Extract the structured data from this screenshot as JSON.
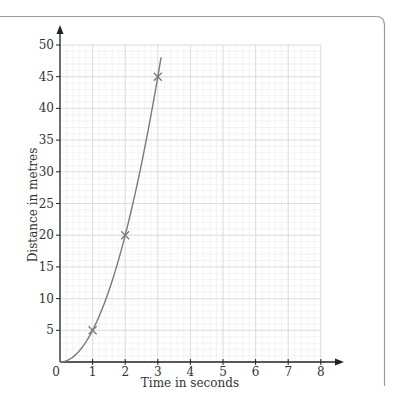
{
  "chart_data": {
    "type": "line",
    "title": "",
    "xlabel": "Time in seconds",
    "ylabel": "Distance in metres",
    "xlim": [
      0,
      8
    ],
    "ylim": [
      0,
      50
    ],
    "x_ticks": [
      "0",
      "1",
      "2",
      "3",
      "4",
      "5",
      "6",
      "7",
      "8"
    ],
    "y_ticks": [
      "5",
      "10",
      "15",
      "20",
      "25",
      "30",
      "35",
      "40",
      "45",
      "50"
    ],
    "grid": true,
    "grid_major_x": 1,
    "grid_minor_x": 0.2,
    "grid_major_y": 5,
    "grid_minor_y": 1,
    "series": [
      {
        "name": "distance curve",
        "kind": "curve",
        "formula": "d = 5t^2",
        "x": [
          0,
          0.5,
          1,
          1.5,
          2,
          2.5,
          3,
          3.1
        ],
        "values": [
          0,
          1.25,
          5,
          11.25,
          20,
          31.25,
          45,
          48
        ]
      },
      {
        "name": "plotted points",
        "kind": "markers",
        "marker": "x",
        "x": [
          1,
          2,
          3
        ],
        "values": [
          5,
          20,
          45
        ]
      }
    ],
    "legend": null
  },
  "colors": {
    "axis": "#222222",
    "curve": "#7a7a7a",
    "grid_major": "#dcdcdc",
    "grid_minor": "#efefef",
    "frame": "#9a9a9a"
  }
}
